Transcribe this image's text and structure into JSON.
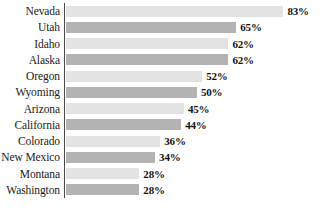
{
  "chart_data": {
    "type": "bar",
    "orientation": "horizontal",
    "title": "",
    "subtitle": "",
    "xlabel": "",
    "ylabel": "",
    "xlim": [
      0,
      100
    ],
    "grid": false,
    "legend": null,
    "value_suffix": "%",
    "categories": [
      "Nevada",
      "Utah",
      "Idaho",
      "Alaska",
      "Oregon",
      "Wyoming",
      "Arizona",
      "California",
      "Colorado",
      "New Mexico",
      "Montana",
      "Washington"
    ],
    "values": [
      83,
      65,
      62,
      62,
      52,
      50,
      45,
      44,
      36,
      34,
      28,
      28
    ],
    "value_labels": [
      "83%",
      "65%",
      "62%",
      "62%",
      "52%",
      "50%",
      "45%",
      "44%",
      "36%",
      "34%",
      "28%",
      "28%"
    ],
    "bars": [
      {
        "label": "Nevada",
        "value": 83,
        "value_label": "83%",
        "shade": "light"
      },
      {
        "label": "Utah",
        "value": 65,
        "value_label": "65%",
        "shade": "dark"
      },
      {
        "label": "Idaho",
        "value": 62,
        "value_label": "62%",
        "shade": "light"
      },
      {
        "label": "Alaska",
        "value": 62,
        "value_label": "62%",
        "shade": "dark"
      },
      {
        "label": "Oregon",
        "value": 52,
        "value_label": "52%",
        "shade": "light"
      },
      {
        "label": "Wyoming",
        "value": 50,
        "value_label": "50%",
        "shade": "dark"
      },
      {
        "label": "Arizona",
        "value": 45,
        "value_label": "45%",
        "shade": "light"
      },
      {
        "label": "California",
        "value": 44,
        "value_label": "44%",
        "shade": "dark"
      },
      {
        "label": "Colorado",
        "value": 36,
        "value_label": "36%",
        "shade": "light"
      },
      {
        "label": "New Mexico",
        "value": 34,
        "value_label": "34%",
        "shade": "dark"
      },
      {
        "label": "Montana",
        "value": 28,
        "value_label": "28%",
        "shade": "light"
      },
      {
        "label": "Washington",
        "value": 28,
        "value_label": "28%",
        "shade": "dark"
      }
    ],
    "colors": {
      "bar_light": "#e3e3e3",
      "bar_dark": "#b3b3b3",
      "axis": "#4a4a4a",
      "label_text": "#1a1a1a",
      "value_text": "#111111",
      "background": "#ffffff"
    },
    "scale": {
      "px_per_percent": 2.62,
      "axis_x_px": 64,
      "bar_start_x_px": 66
    }
  }
}
